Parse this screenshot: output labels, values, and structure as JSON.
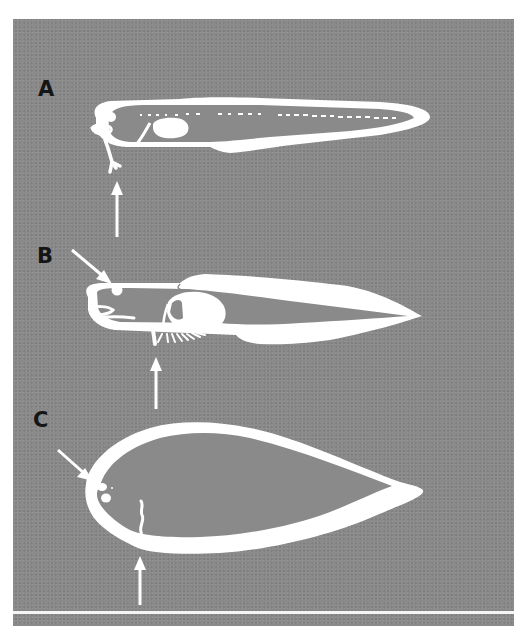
{
  "figure": {
    "background_color": "#8a8a8a",
    "foreground_color": "#ffffff",
    "label_color": "#151515",
    "panels": [
      {
        "id": "A",
        "label": "A",
        "description": "Elongate larva with dotted notochord, yolk/gut mass and forward-projecting appendage; arrow pointing up at trailing appendage"
      },
      {
        "id": "B",
        "label": "B",
        "description": "Larva with enlarged dorsal and ventral fin folds, oval gut mass and fringed ventral structure; arrow to eye and arrow pointing up at ventral structure"
      },
      {
        "id": "C",
        "label": "C",
        "description": "Deep-bodied leaf-shaped larva with two eye spots; arrow to eyes and arrow pointing up at ventral structure"
      }
    ],
    "arrows": [
      {
        "panel": "A",
        "direction": "up",
        "target": "appendage"
      },
      {
        "panel": "B",
        "direction": "down-right",
        "target": "eye"
      },
      {
        "panel": "B",
        "direction": "up",
        "target": "ventral-fringe"
      },
      {
        "panel": "C",
        "direction": "down-right",
        "target": "eyes"
      },
      {
        "panel": "C",
        "direction": "up",
        "target": "ventral-structure"
      }
    ]
  }
}
